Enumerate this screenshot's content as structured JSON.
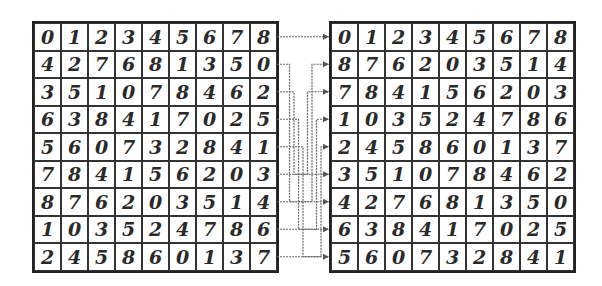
{
  "diagram": {
    "type": "row-permutation",
    "left_grid": [
      [
        "0",
        "1",
        "2",
        "3",
        "4",
        "5",
        "6",
        "7",
        "8"
      ],
      [
        "4",
        "2",
        "7",
        "6",
        "8",
        "1",
        "3",
        "5",
        "0"
      ],
      [
        "3",
        "5",
        "1",
        "0",
        "7",
        "8",
        "4",
        "6",
        "2"
      ],
      [
        "6",
        "3",
        "8",
        "4",
        "1",
        "7",
        "0",
        "2",
        "5"
      ],
      [
        "5",
        "6",
        "0",
        "7",
        "3",
        "2",
        "8",
        "4",
        "1"
      ],
      [
        "7",
        "8",
        "4",
        "1",
        "5",
        "6",
        "2",
        "0",
        "3"
      ],
      [
        "8",
        "7",
        "6",
        "2",
        "0",
        "3",
        "5",
        "1",
        "4"
      ],
      [
        "1",
        "0",
        "3",
        "5",
        "2",
        "4",
        "7",
        "8",
        "6"
      ],
      [
        "2",
        "4",
        "5",
        "8",
        "6",
        "0",
        "1",
        "3",
        "7"
      ]
    ],
    "right_grid": [
      [
        "0",
        "1",
        "2",
        "3",
        "4",
        "5",
        "6",
        "7",
        "8"
      ],
      [
        "8",
        "7",
        "6",
        "2",
        "0",
        "3",
        "5",
        "1",
        "4"
      ],
      [
        "7",
        "8",
        "4",
        "1",
        "5",
        "6",
        "2",
        "0",
        "3"
      ],
      [
        "1",
        "0",
        "3",
        "5",
        "2",
        "4",
        "7",
        "8",
        "6"
      ],
      [
        "2",
        "4",
        "5",
        "8",
        "6",
        "0",
        "1",
        "3",
        "7"
      ],
      [
        "3",
        "5",
        "1",
        "0",
        "7",
        "8",
        "4",
        "6",
        "2"
      ],
      [
        "4",
        "2",
        "7",
        "6",
        "8",
        "1",
        "3",
        "5",
        "0"
      ],
      [
        "6",
        "3",
        "8",
        "4",
        "1",
        "7",
        "0",
        "2",
        "5"
      ],
      [
        "5",
        "6",
        "0",
        "7",
        "3",
        "2",
        "8",
        "4",
        "1"
      ]
    ],
    "row_mapping": [
      {
        "from": 0,
        "to": 0
      },
      {
        "from": 1,
        "to": 6
      },
      {
        "from": 2,
        "to": 5
      },
      {
        "from": 3,
        "to": 7
      },
      {
        "from": 4,
        "to": 8
      },
      {
        "from": 5,
        "to": 2
      },
      {
        "from": 6,
        "to": 1
      },
      {
        "from": 7,
        "to": 3
      },
      {
        "from": 8,
        "to": 4
      }
    ]
  }
}
